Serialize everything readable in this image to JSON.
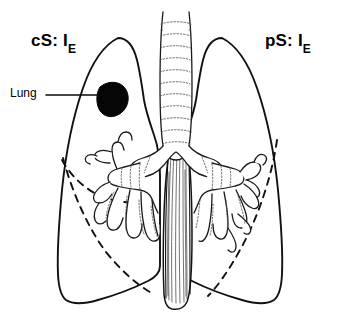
{
  "figure": {
    "type": "anatomical-diagram",
    "background_color": "#ffffff",
    "ink_color": "#111111",
    "width": 341,
    "height": 334
  },
  "labels": {
    "left_side": {
      "text": "cS: I",
      "subscript": "E",
      "full": "cS: IE"
    },
    "right_side": {
      "text": "pS: I",
      "subscript": "E",
      "full": "pS: IE"
    },
    "callout": {
      "text": "Lung"
    }
  },
  "structures": {
    "left_lung": "left-lung-outline",
    "right_lung": "right-lung-outline",
    "trachea": "trachea",
    "carina": "carina",
    "left_bronchial_tree": "left-bronchial-tree",
    "right_bronchial_tree": "right-bronchial-tree",
    "esophagus": "esophagus",
    "nodule": "lung-nodule",
    "left_fissures": [
      "horizontal-fissure",
      "oblique-fissure"
    ],
    "right_fissures": [
      "oblique-fissure"
    ]
  },
  "colors": {
    "nodule": "#050505",
    "outline": "#111111",
    "fill": "#ffffff"
  }
}
